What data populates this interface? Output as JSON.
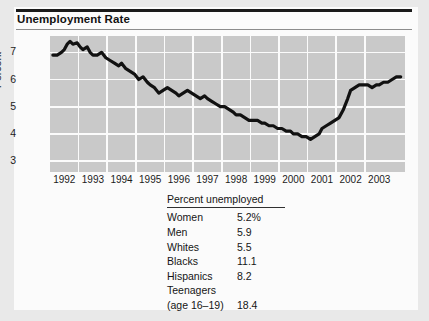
{
  "figure": {
    "title": "Unemployment Rate"
  },
  "chart_data": {
    "type": "line",
    "title": "Unemployment Rate",
    "xlabel": "",
    "ylabel": "Percent",
    "ylim": [
      2.6,
      7.6
    ],
    "yticks": [
      3,
      4,
      5,
      6,
      7
    ],
    "ytick_labels": [
      "3",
      "4",
      "5",
      "6",
      "7"
    ],
    "xlim": [
      1991.5,
      2003.9
    ],
    "xtick_labels": [
      "1992",
      "1993",
      "1994",
      "1995",
      "1996",
      "1997",
      "1998",
      "1999",
      "2000",
      "2001",
      "2002",
      "2003"
    ],
    "grid": true,
    "legend": "none",
    "series": [
      {
        "name": "Unemployment rate",
        "x": [
          1991.6,
          1991.75,
          1991.9,
          1992.0,
          1992.1,
          1992.2,
          1992.3,
          1992.45,
          1992.55,
          1992.65,
          1992.8,
          1992.9,
          1993.0,
          1993.15,
          1993.3,
          1993.45,
          1993.6,
          1993.75,
          1993.9,
          1994.0,
          1994.15,
          1994.3,
          1994.45,
          1994.6,
          1994.75,
          1994.9,
          1995.0,
          1995.15,
          1995.3,
          1995.45,
          1995.6,
          1995.75,
          1995.9,
          1996.0,
          1996.15,
          1996.3,
          1996.45,
          1996.6,
          1996.75,
          1996.9,
          1997.0,
          1997.15,
          1997.3,
          1997.45,
          1997.6,
          1997.75,
          1997.9,
          1998.0,
          1998.15,
          1998.3,
          1998.45,
          1998.6,
          1998.75,
          1998.9,
          1999.0,
          1999.15,
          1999.3,
          1999.45,
          1999.6,
          1999.75,
          1999.9,
          2000.0,
          2000.15,
          2000.3,
          2000.45,
          2000.6,
          2000.75,
          2000.9,
          2001.0,
          2001.15,
          2001.3,
          2001.45,
          2001.6,
          2001.75,
          2001.9,
          2002.0,
          2002.15,
          2002.3,
          2002.45,
          2002.6,
          2002.75,
          2002.9,
          2003.0,
          2003.15,
          2003.3,
          2003.45,
          2003.6,
          2003.75
        ],
        "y": [
          6.9,
          6.9,
          7.0,
          7.1,
          7.3,
          7.4,
          7.3,
          7.35,
          7.2,
          7.1,
          7.2,
          7.0,
          6.9,
          6.9,
          7.0,
          6.8,
          6.7,
          6.6,
          6.5,
          6.6,
          6.4,
          6.3,
          6.2,
          6.0,
          6.1,
          5.9,
          5.8,
          5.7,
          5.5,
          5.6,
          5.7,
          5.6,
          5.5,
          5.4,
          5.5,
          5.6,
          5.5,
          5.4,
          5.3,
          5.4,
          5.3,
          5.2,
          5.1,
          5.0,
          5.0,
          4.9,
          4.8,
          4.7,
          4.7,
          4.6,
          4.5,
          4.5,
          4.5,
          4.4,
          4.4,
          4.3,
          4.3,
          4.2,
          4.2,
          4.1,
          4.1,
          4.0,
          4.0,
          3.9,
          3.9,
          3.8,
          3.9,
          4.0,
          4.2,
          4.3,
          4.4,
          4.5,
          4.6,
          4.9,
          5.3,
          5.6,
          5.7,
          5.8,
          5.8,
          5.8,
          5.7,
          5.8,
          5.8,
          5.9,
          5.9,
          6.0,
          6.1,
          6.1
        ]
      }
    ]
  },
  "table": {
    "header": "Percent unemployed",
    "rows": [
      {
        "label": "Women",
        "value": "5.2%"
      },
      {
        "label": "Men",
        "value": "5.9"
      },
      {
        "label": "Whites",
        "value": "5.5"
      },
      {
        "label": "Blacks",
        "value": "11.1"
      },
      {
        "label": "Hispanics",
        "value": "8.2"
      },
      {
        "label": "Teenagers",
        "label2": "(age 16–19)",
        "value": "18.4"
      }
    ]
  },
  "colors": {
    "plot_background": "#c9c9c9",
    "gridline": "#fbfbfb",
    "series_line": "#111111",
    "card_background": "#fbfbfb",
    "page_background": "#e9e9e9"
  }
}
